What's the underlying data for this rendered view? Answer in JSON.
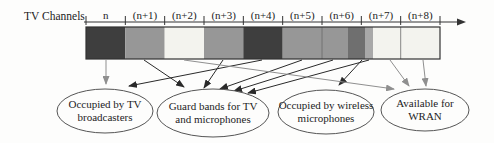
{
  "axis": {
    "title": "TV Channels",
    "channels": [
      "n",
      "(n+1)",
      "(n+2)",
      "(n+3)",
      "(n+4)",
      "(n+5)",
      "(n+6)",
      "(n+7)",
      "(n+8)"
    ],
    "x_start": 86,
    "x_end": 440,
    "axis_y": 22,
    "arrow_tip_x": 466,
    "tick_top": 16,
    "tick_bottom": 25
  },
  "colors": {
    "tv_dark": "#3e3e3e",
    "guard_medium": "#979797",
    "wireless_mic": "#6f6f6f",
    "guard_light_strip": "#a8a8a8",
    "available_white": "#f3f3ee",
    "bar_stroke": "#333333",
    "hairline": "#6a6a6a",
    "arrow_black": "#2a2a2a",
    "arrow_gray": "#8f8f8f",
    "ellipse_stroke": "#555555"
  },
  "bar": {
    "y_top": 27,
    "height": 32,
    "segments": [
      {
        "x1": 86.0,
        "x2": 125.3,
        "color": "tv_dark",
        "category": "occupied-by-tv"
      },
      {
        "x1": 125.3,
        "x2": 164.7,
        "color": "guard_medium",
        "category": "guard-band"
      },
      {
        "x1": 164.7,
        "x2": 204.0,
        "color": "available_white",
        "category": "available-for-wran"
      },
      {
        "x1": 204.0,
        "x2": 243.3,
        "color": "guard_medium",
        "category": "guard-band"
      },
      {
        "x1": 243.3,
        "x2": 282.7,
        "color": "tv_dark",
        "category": "occupied-by-tv"
      },
      {
        "x1": 282.7,
        "x2": 348.0,
        "color": "guard_medium",
        "category": "guard-band"
      },
      {
        "x1": 348.0,
        "x2": 365.0,
        "color": "wireless_mic",
        "category": "occupied-by-wireless-mic"
      },
      {
        "x1": 365.0,
        "x2": 373.0,
        "color": "guard_light_strip",
        "category": "guard-band"
      },
      {
        "x1": 373.0,
        "x2": 440.0,
        "color": "available_white",
        "category": "available-for-wran"
      }
    ],
    "hairlines_x": [
      322.0,
      400.7
    ]
  },
  "ellipses": [
    {
      "cx": 105,
      "cy": 111,
      "rx": 48,
      "ry": 22,
      "lines": [
        "Occupied by TV",
        "broadcasters"
      ]
    },
    {
      "cx": 213,
      "cy": 113,
      "rx": 56,
      "ry": 24,
      "lines": [
        "Guard bands for TV",
        "and microphones"
      ]
    },
    {
      "cx": 326,
      "cy": 112,
      "rx": 48,
      "ry": 22,
      "lines": [
        "Occupied by wireless",
        "microphones"
      ]
    },
    {
      "cx": 425,
      "cy": 110,
      "rx": 44,
      "ry": 21,
      "lines": [
        "Available for",
        "WRAN"
      ]
    }
  ],
  "arrows": [
    {
      "x1": 106,
      "y1": 60,
      "x2": 106,
      "y2": 84,
      "color": "arrow_gray",
      "target": "occupied-by-tv-broadcasters"
    },
    {
      "x1": 262,
      "y1": 60,
      "x2": 129,
      "y2": 86,
      "color": "arrow_black",
      "target": "occupied-by-tv-broadcasters"
    },
    {
      "x1": 144,
      "y1": 60,
      "x2": 184,
      "y2": 87,
      "color": "arrow_black",
      "target": "guard-bands"
    },
    {
      "x1": 223,
      "y1": 60,
      "x2": 204,
      "y2": 88,
      "color": "arrow_black",
      "target": "guard-bands"
    },
    {
      "x1": 302,
      "y1": 60,
      "x2": 220,
      "y2": 89,
      "color": "arrow_black",
      "target": "guard-bands"
    },
    {
      "x1": 333,
      "y1": 60,
      "x2": 234,
      "y2": 91,
      "color": "arrow_black",
      "target": "guard-bands"
    },
    {
      "x1": 369,
      "y1": 60,
      "x2": 248,
      "y2": 93,
      "color": "arrow_black",
      "target": "guard-bands"
    },
    {
      "x1": 362,
      "y1": 60,
      "x2": 339,
      "y2": 85,
      "color": "arrow_black",
      "target": "occupied-by-wireless-microphones"
    },
    {
      "x1": 184,
      "y1": 60,
      "x2": 394,
      "y2": 89,
      "color": "arrow_gray",
      "target": "available-for-wran"
    },
    {
      "x1": 390,
      "y1": 60,
      "x2": 409,
      "y2": 86,
      "color": "arrow_gray",
      "target": "available-for-wran"
    },
    {
      "x1": 423,
      "y1": 60,
      "x2": 426,
      "y2": 86,
      "color": "arrow_gray",
      "target": "available-for-wran"
    }
  ]
}
